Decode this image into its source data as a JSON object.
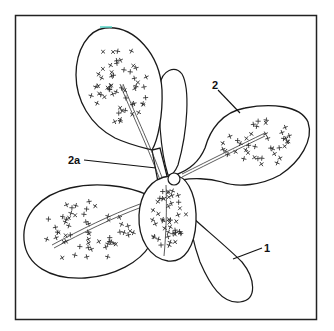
{
  "figure": {
    "labels": [
      {
        "id": "label-1",
        "text": "1",
        "refers_to": "cotyledon"
      },
      {
        "id": "label-2",
        "text": "2",
        "refers_to": "foliage leaf"
      },
      {
        "id": "label-2a",
        "text": "2a",
        "refers_to": "petiole"
      }
    ],
    "accent_color": "#5ad6c8"
  }
}
